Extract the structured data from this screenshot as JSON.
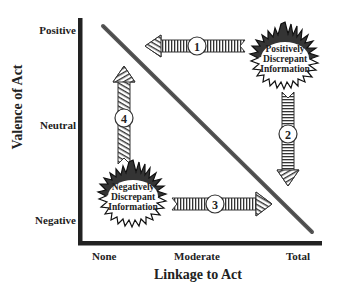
{
  "diagram": {
    "y_axis": {
      "title": "Valence of Act",
      "ticks": [
        "Positive",
        "Neutral",
        "Negative"
      ]
    },
    "x_axis": {
      "title": "Linkage to Act",
      "ticks": [
        "None",
        "Moderate",
        "Total"
      ]
    },
    "bursts": {
      "positive": {
        "line1": "Positively",
        "line2": "Discrepant",
        "line3": "Information"
      },
      "negative": {
        "line1": "Negatively",
        "line2": "Discrepant",
        "line3": "Information"
      }
    },
    "arrows": [
      {
        "id": "1",
        "label": "1",
        "direction": "left"
      },
      {
        "id": "2",
        "label": "2",
        "direction": "down"
      },
      {
        "id": "3",
        "label": "3",
        "direction": "right"
      },
      {
        "id": "4",
        "label": "4",
        "direction": "up"
      }
    ],
    "colors": {
      "axis": "#222222",
      "diagonal": "#555555",
      "ink": "#222222",
      "background": "#ffffff"
    }
  }
}
